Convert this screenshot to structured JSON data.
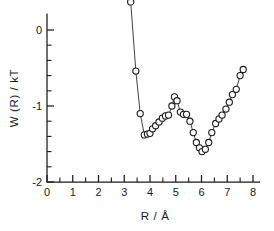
{
  "chart_data": {
    "type": "scatter",
    "title": "",
    "xlabel": "R / Å",
    "ylabel": "W (R) / kT",
    "xlim": [
      0,
      8.3
    ],
    "ylim": [
      -2,
      0.55
    ],
    "grid": false,
    "legend_position": "none",
    "marker": "open-circle",
    "connected": true,
    "x_major_ticks": [
      0,
      1,
      2,
      3,
      4,
      5,
      6,
      7,
      8
    ],
    "x_major_tick_labels": [
      "0",
      "1",
      "2",
      "3",
      "4",
      "5",
      "6",
      "7",
      "8"
    ],
    "x_minor_tick_step": 0.5,
    "y_major_ticks": [
      0,
      -1,
      -2
    ],
    "y_major_tick_labels": [
      "0",
      "-1",
      "-2"
    ],
    "y_minor_tick_step": 0.2,
    "x": [
      3.25,
      3.45,
      3.62,
      3.78,
      3.9,
      4.0,
      4.1,
      4.22,
      4.35,
      4.48,
      4.6,
      4.72,
      4.85,
      4.95,
      5.05,
      5.18,
      5.3,
      5.42,
      5.55,
      5.68,
      5.8,
      5.92,
      6.02,
      6.15,
      6.28,
      6.4,
      6.55,
      6.68,
      6.8,
      6.95,
      7.08,
      7.2,
      7.35,
      7.5,
      7.62
    ],
    "y": [
      0.37,
      -0.54,
      -1.1,
      -1.38,
      -1.37,
      -1.36,
      -1.3,
      -1.26,
      -1.21,
      -1.16,
      -1.13,
      -1.12,
      -1.0,
      -0.88,
      -0.93,
      -1.08,
      -1.11,
      -1.11,
      -1.2,
      -1.35,
      -1.48,
      -1.55,
      -1.6,
      -1.57,
      -1.48,
      -1.35,
      -1.23,
      -1.17,
      -1.12,
      -1.04,
      -0.95,
      -0.85,
      -0.78,
      -0.6,
      -0.52
    ],
    "series": [
      {
        "name": "W(R)/kT",
        "x": [
          3.25,
          3.45,
          3.62,
          3.78,
          3.9,
          4.0,
          4.1,
          4.22,
          4.35,
          4.48,
          4.6,
          4.72,
          4.85,
          4.95,
          5.05,
          5.18,
          5.3,
          5.42,
          5.55,
          5.68,
          5.8,
          5.92,
          6.02,
          6.15,
          6.28,
          6.4,
          6.55,
          6.68,
          6.8,
          6.95,
          7.08,
          7.2,
          7.35,
          7.5,
          7.62
        ],
        "values": [
          0.37,
          -0.54,
          -1.1,
          -1.38,
          -1.37,
          -1.36,
          -1.3,
          -1.26,
          -1.21,
          -1.16,
          -1.13,
          -1.12,
          -1.0,
          -0.88,
          -0.93,
          -1.08,
          -1.11,
          -1.11,
          -1.2,
          -1.35,
          -1.48,
          -1.55,
          -1.6,
          -1.57,
          -1.48,
          -1.35,
          -1.23,
          -1.17,
          -1.12,
          -1.04,
          -0.95,
          -0.85,
          -0.78,
          -0.6,
          -0.52
        ]
      }
    ],
    "features": {
      "first_minimum": {
        "x": 3.78,
        "y": -1.38
      },
      "local_maximum": {
        "x": 4.95,
        "y": -0.88
      },
      "second_minimum": {
        "x": 6.02,
        "y": -1.6
      }
    },
    "colors": {
      "axis": "#1a1a1a",
      "marker_stroke": "#1a1a1a",
      "marker_fill": "#ffffff",
      "line": "#2b2b2b",
      "background": "#ffffff"
    }
  }
}
